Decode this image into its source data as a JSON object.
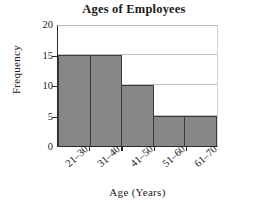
{
  "chart_data": {
    "type": "bar",
    "title": "Ages of Employees",
    "xlabel": "Age (Years)",
    "ylabel": "Frequency",
    "categories": [
      "21–30",
      "31–40",
      "41–50",
      "51–60",
      "61–70"
    ],
    "values": [
      15,
      15,
      10,
      5,
      5
    ],
    "ylim": [
      0,
      20
    ],
    "yticks": [
      0,
      5,
      10,
      15,
      20
    ],
    "ytick_labels": [
      "0",
      "5",
      "10",
      "15",
      "20"
    ],
    "grid": "horizontal",
    "legend": "none",
    "bar_fill_color": "#878787",
    "bar_border_color": "#3a3a3a",
    "gridline_color": "#c2c2c2",
    "axis_color": "#2b2b2b",
    "background_color": "#ffffff",
    "xtick_label_rotation": -42
  }
}
